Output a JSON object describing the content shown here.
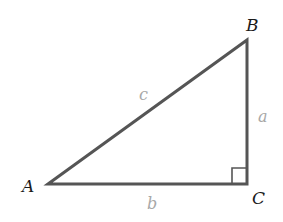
{
  "diagram": {
    "type": "right-triangle",
    "stroke_color": "#555555",
    "vertex_label_color": "#1a1a1a",
    "side_label_color": "#a8a8a8",
    "vertices": {
      "A": {
        "label": "A",
        "x": 48,
        "y": 184
      },
      "B": {
        "label": "B",
        "x": 247,
        "y": 40
      },
      "C": {
        "label": "C",
        "x": 247,
        "y": 184
      }
    },
    "sides": {
      "a": {
        "label": "a",
        "between": [
          "B",
          "C"
        ]
      },
      "b": {
        "label": "b",
        "between": [
          "A",
          "C"
        ]
      },
      "c": {
        "label": "c",
        "between": [
          "A",
          "B"
        ]
      }
    },
    "right_angle_at": "C"
  }
}
